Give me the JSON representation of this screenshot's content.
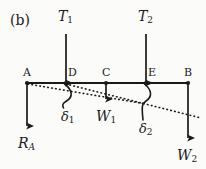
{
  "figure": {
    "panel_label": "(b)",
    "beam": {
      "y": 83,
      "x_start": 27,
      "x_end": 188
    },
    "points": [
      {
        "name": "A",
        "label": "A",
        "x": 27,
        "label_x": 23,
        "label_y": 67
      },
      {
        "name": "D",
        "label": "D",
        "x": 66,
        "label_x": 68,
        "label_y": 67
      },
      {
        "name": "C",
        "label": "C",
        "x": 106,
        "label_x": 103,
        "label_y": 67
      },
      {
        "name": "E",
        "label": "E",
        "x": 146,
        "label_x": 148,
        "label_y": 67
      },
      {
        "name": "B",
        "label": "B",
        "x": 188,
        "label_x": 185,
        "label_y": 67
      }
    ],
    "forces": [
      {
        "name": "T1",
        "symbol": "T",
        "subscript": "1",
        "direction": "up",
        "at_point": "D",
        "x": 66,
        "tail_y": 83,
        "head_y": 33,
        "label_x": 57,
        "label_y": 10
      },
      {
        "name": "T2",
        "symbol": "T",
        "subscript": "2",
        "direction": "up",
        "at_point": "E",
        "x": 146,
        "tail_y": 83,
        "head_y": 33,
        "label_x": 137,
        "label_y": 10
      },
      {
        "name": "W1",
        "symbol": "W",
        "subscript": "1",
        "direction": "down",
        "at_point": "C",
        "x": 106,
        "tail_y": 83,
        "head_y": 106,
        "label_x": 96,
        "label_y": 110
      },
      {
        "name": "RA",
        "symbol": "R",
        "subscript": "A",
        "subscript_italic": true,
        "direction": "down",
        "at_point": "A",
        "x": 27,
        "tail_y": 83,
        "head_y": 133,
        "label_x": 18,
        "label_y": 137
      },
      {
        "name": "W2",
        "symbol": "W",
        "subscript": "2",
        "direction": "down",
        "at_point": "B",
        "x": 188,
        "tail_y": 83,
        "head_y": 145,
        "label_x": 177,
        "label_y": 149
      }
    ],
    "deflection_lines": [
      {
        "name": "deflection-line-1",
        "x1": 28,
        "y1": 84,
        "x2": 146,
        "y2": 104
      },
      {
        "name": "deflection-line-2",
        "x1": 66,
        "y1": 84,
        "x2": 200,
        "y2": 118
      }
    ],
    "angles": [
      {
        "name": "delta1",
        "label": "δ",
        "subscript": "1",
        "at_point": "D",
        "label_x": 61,
        "label_y": 110
      },
      {
        "name": "delta2",
        "label": "δ",
        "subscript": "2",
        "at_point": "E",
        "label_x": 139,
        "label_y": 122
      }
    ],
    "colors": {
      "ink": "#1a1a1a",
      "background": "#fbfbfa"
    }
  }
}
